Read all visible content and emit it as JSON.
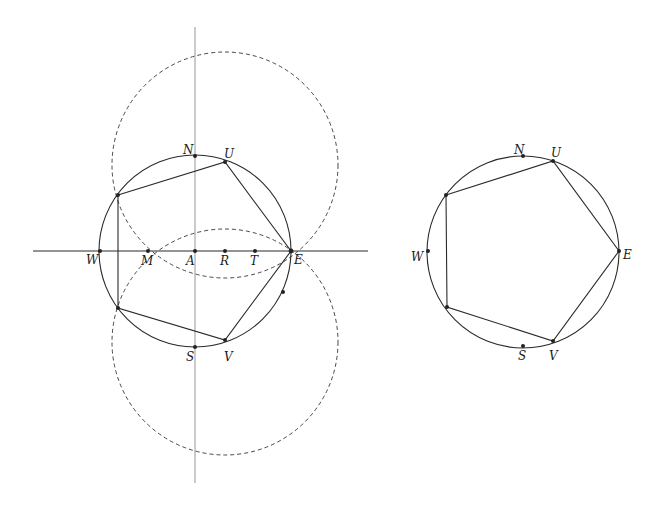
{
  "colors": {
    "stroke": "#2a2a2a",
    "guide": "#8a8a8a",
    "dashed": "#333333",
    "background": "#ffffff"
  },
  "left_figure": {
    "labels": {
      "N": "N",
      "U": "U",
      "W": "W",
      "M": "M",
      "A": "A",
      "R": "R",
      "T": "T",
      "E": "E",
      "S": "S",
      "V": "V"
    }
  },
  "right_figure": {
    "labels": {
      "N": "N",
      "U": "U",
      "W": "W",
      "E": "E",
      "S": "S",
      "V": "V"
    }
  }
}
